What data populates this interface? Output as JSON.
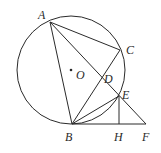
{
  "diagram": {
    "type": "geometry",
    "circle": {
      "name": "circle-O",
      "cx": 71,
      "cy": 70,
      "r": 54
    },
    "points": {
      "A": {
        "x": 50,
        "y": 22
      },
      "B": {
        "x": 72,
        "y": 124
      },
      "C": {
        "x": 120,
        "y": 50
      },
      "D": {
        "x": 102,
        "y": 79
      },
      "E": {
        "x": 119,
        "y": 96
      },
      "H": {
        "x": 119,
        "y": 124
      },
      "F": {
        "x": 146,
        "y": 124
      },
      "O": {
        "x": 71,
        "y": 70
      }
    },
    "segments": [
      [
        "A",
        "B"
      ],
      [
        "A",
        "C"
      ],
      [
        "A",
        "F"
      ],
      [
        "B",
        "C"
      ],
      [
        "B",
        "E"
      ],
      [
        "B",
        "F"
      ],
      [
        "E",
        "H"
      ]
    ],
    "labels": {
      "A": "A",
      "B": "B",
      "C": "C",
      "D": "D",
      "E": "E",
      "H": "H",
      "F": "F",
      "O": "O"
    }
  }
}
